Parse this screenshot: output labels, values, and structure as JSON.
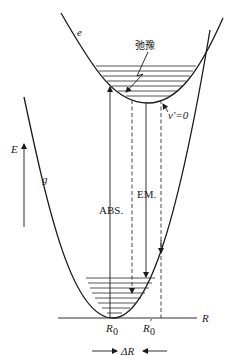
{
  "diagram": {
    "type": "potential-energy-curves",
    "curves": {
      "excited": {
        "label": "e"
      },
      "ground": {
        "label": "g"
      }
    },
    "annotations": {
      "relaxation": "弛豫",
      "lowest_vibrational_level": "v'=0",
      "absorption": "ABS.",
      "emission": "EM."
    },
    "axes": {
      "energy": {
        "label": "E"
      },
      "distance": {
        "label": "R"
      }
    },
    "positions": {
      "ground_equilibrium": "R",
      "ground_equilibrium_sub": "0",
      "excited_equilibrium": "R",
      "excited_equilibrium_sub": "0",
      "excited_equilibrium_prime": "′",
      "offset": "ΔR"
    },
    "colors": {
      "line": "#1a1a1a",
      "background": "#ffffff"
    }
  }
}
